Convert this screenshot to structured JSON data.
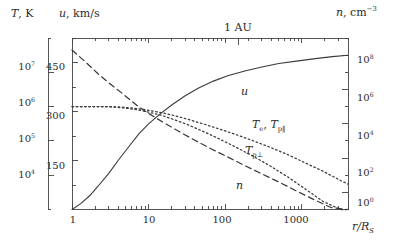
{
  "figure": {
    "annotation_top": "1 AU",
    "axes": {
      "left_outer": {
        "name": "temperature-axis",
        "title_symbol": "T",
        "title_unit": ", K",
        "ticks": [
          "10⁴",
          "10⁵",
          "10⁶",
          "10⁷"
        ],
        "tick_exponents": [
          4,
          5,
          6,
          7
        ],
        "scale": "log",
        "range": [
          1000,
          100000000
        ]
      },
      "left_inner": {
        "name": "velocity-axis",
        "title_symbol": "u",
        "title_unit": ", km/s",
        "ticks": [
          "150",
          "300",
          "450"
        ],
        "tick_values": [
          150,
          300,
          450
        ],
        "scale": "linear",
        "range": [
          0,
          525
        ]
      },
      "right": {
        "name": "density-axis",
        "title_symbol": "n",
        "title_unit": ", cm",
        "title_exponent": "−3",
        "ticks": [
          "10⁰",
          "10²",
          "10⁴",
          "10⁶",
          "10⁸"
        ],
        "tick_exponents": [
          0,
          2,
          4,
          6,
          8
        ],
        "scale": "log",
        "range": [
          0.1,
          1000000000
        ]
      },
      "bottom": {
        "name": "radius-axis",
        "title_symbol": "r/R",
        "title_sub": "S",
        "ticks": [
          "1",
          "10",
          "100",
          "1000"
        ],
        "tick_values": [
          1,
          10,
          100,
          1000
        ],
        "scale": "log",
        "range": [
          1,
          4000
        ]
      }
    },
    "curve_labels": {
      "u": "u",
      "t_par": "T",
      "t_par_sub1": "e",
      "t_par_sep": ", ",
      "t_par_sym2": "T",
      "t_par_sub2": "p‖",
      "t_perp": "T",
      "t_perp_sub": "p⊥",
      "n": "n"
    }
  },
  "chart_data": {
    "type": "line",
    "title": "",
    "subtitle": "1 AU",
    "xlabel": "r/R_S",
    "ylabel": "T, K  /  u, km/s",
    "y2label": "n, cm^-3",
    "xscale": "log",
    "xlim": [
      1,
      4000
    ],
    "grid": false,
    "legend_position": "inline-annotations",
    "axes_definitions": {
      "velocity_axis": {
        "scale": "linear",
        "lim": [
          0,
          525
        ],
        "ticks": [
          150,
          300,
          450
        ],
        "unit": "km/s"
      },
      "temperature_axis": {
        "scale": "log",
        "lim": [
          1000,
          100000000
        ],
        "ticks": [
          10000,
          100000,
          1000000,
          10000000
        ],
        "unit": "K"
      },
      "density_axis": {
        "scale": "log",
        "lim": [
          0.1,
          1000000000
        ],
        "ticks": [
          1,
          100,
          10000,
          1000000,
          100000000
        ],
        "unit": "cm^-3"
      }
    },
    "series": [
      {
        "name": "u",
        "label": "u",
        "axis": "velocity_axis",
        "style": "solid",
        "units": "km/s",
        "x": [
          1,
          1.3,
          1.7,
          2.2,
          3,
          4,
          5.5,
          7.5,
          10,
          14,
          20,
          30,
          45,
          70,
          110,
          180,
          300,
          500,
          900,
          1500,
          2500,
          4000
        ],
        "y": [
          0,
          18,
          42,
          72,
          110,
          150,
          192,
          232,
          262,
          292,
          320,
          348,
          372,
          393,
          410,
          424,
          436,
          447,
          455,
          462,
          468,
          472
        ]
      },
      {
        "name": "Te, Tp_parallel",
        "label": "T_e, T_p‖",
        "axis": "temperature_axis",
        "style": "dotted",
        "units": "K",
        "x": [
          1,
          1.5,
          2.2,
          3,
          4,
          5.5,
          7.5,
          10,
          15,
          22,
          32,
          50,
          80,
          130,
          220,
          380,
          650,
          1100,
          1900,
          3200,
          4000
        ],
        "y": [
          1000000,
          1000000,
          1000000,
          1000000,
          980000,
          930000,
          860000,
          780000,
          660000,
          540000,
          430000,
          320000,
          230000,
          160000,
          105000,
          66000,
          40000,
          23000,
          13000,
          7000,
          5500
        ]
      },
      {
        "name": "Tp_perp",
        "label": "T_p⊥",
        "axis": "temperature_axis",
        "style": "dotted",
        "units": "K",
        "x": [
          1,
          1.5,
          2.2,
          3,
          4,
          5.5,
          7.5,
          10,
          15,
          22,
          32,
          50,
          80,
          130,
          220,
          380,
          650,
          1100,
          1900,
          3200,
          4000
        ],
        "y": [
          1000000,
          1000000,
          1000000,
          990000,
          950000,
          880000,
          790000,
          690000,
          550000,
          410000,
          300000,
          195000,
          120000,
          70000,
          38000,
          19000,
          9000,
          4000,
          1700,
          700,
          480
        ]
      },
      {
        "name": "n",
        "label": "n",
        "axis": "density_axis",
        "style": "dashed",
        "units": "cm^-3",
        "x": [
          1,
          1.5,
          2.2,
          3,
          4.5,
          7,
          10,
          16,
          25,
          40,
          65,
          110,
          180,
          300,
          500,
          850,
          1400,
          2400,
          4000
        ],
        "y": [
          200000000,
          40000000,
          8000000,
          2500000,
          600000,
          120000,
          40000,
          11000,
          3500,
          1100,
          350,
          110,
          36,
          12,
          4,
          1.2,
          0.4,
          0.13,
          0.045
        ]
      }
    ]
  }
}
